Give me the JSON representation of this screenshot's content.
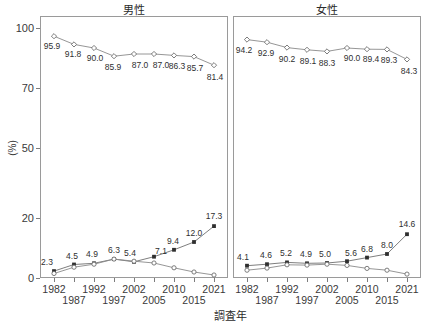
{
  "chart_data": {
    "type": "line",
    "title": "",
    "xlabel": "調査年",
    "ylabel": "(%)",
    "x": [
      1982,
      1987,
      1992,
      1997,
      2002,
      2005,
      2010,
      2015,
      2021
    ],
    "xtick_labels": [
      "1982",
      "1987",
      "1992",
      "1997",
      "2002",
      "2005",
      "2010",
      "2015",
      "2021"
    ],
    "ytick_labels": [
      "0",
      "20",
      "50",
      "70",
      "100"
    ],
    "ytick_values": [
      0,
      20,
      50,
      70,
      100
    ],
    "ylim": [
      0,
      100
    ],
    "y_axis_note": "broken / piecewise-scaled axis",
    "grid": false,
    "legend": "none",
    "panels": [
      {
        "name": "male",
        "title": "男性",
        "series": [
          {
            "name": "top-series",
            "marker": "open-diamond",
            "values": [
              95.9,
              91.8,
              90.0,
              85.9,
              87.0,
              87.0,
              86.3,
              85.7,
              81.4
            ],
            "labels": [
              "95.9",
              "91.8",
              "90.0",
              "85.9",
              "87.0",
              "87.0",
              "86.3",
              "85.7",
              "81.4"
            ]
          },
          {
            "name": "rising-series",
            "marker": "filled-square",
            "values": [
              2.3,
              4.5,
              4.9,
              6.3,
              5.4,
              7.1,
              9.4,
              12.0,
              17.3
            ],
            "labels": [
              "2.3",
              "4.5",
              "4.9",
              "6.3",
              "5.4",
              "7.1",
              "9.4",
              "12.0",
              "17.3"
            ]
          },
          {
            "name": "declining-series",
            "marker": "open-circle",
            "values": [
              1.5,
              3.6,
              4.6,
              6.3,
              5.6,
              5.0,
              3.4,
              2.0,
              1.0
            ],
            "labels": []
          }
        ]
      },
      {
        "name": "female",
        "title": "女性",
        "series": [
          {
            "name": "top-series",
            "marker": "open-diamond",
            "values": [
              94.2,
              92.9,
              90.2,
              89.1,
              88.3,
              90.0,
              89.4,
              89.3,
              84.3
            ],
            "labels": [
              "94.2",
              "92.9",
              "90.2",
              "89.1",
              "88.3",
              "90.0",
              "89.4",
              "89.3",
              "84.3"
            ]
          },
          {
            "name": "rising-series",
            "marker": "filled-square",
            "values": [
              4.1,
              4.6,
              5.2,
              4.9,
              5.0,
              5.6,
              6.8,
              8.0,
              14.6
            ],
            "labels": [
              "4.1",
              "4.6",
              "5.2",
              "4.9",
              "5.0",
              "5.6",
              "6.8",
              "8.0",
              "14.6"
            ]
          },
          {
            "name": "declining-series",
            "marker": "open-circle",
            "values": [
              2.6,
              3.3,
              4.4,
              4.3,
              4.6,
              4.2,
              3.2,
              2.6,
              1.3
            ],
            "labels": []
          }
        ]
      }
    ]
  }
}
